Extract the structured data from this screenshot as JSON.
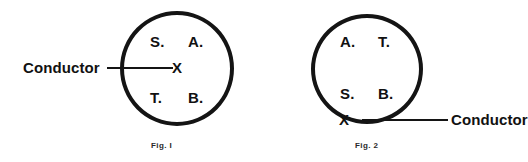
{
  "page": {
    "background_color": "#ffffff",
    "ink_color": "#141414"
  },
  "figures": [
    {
      "id": "fig1",
      "caption": "Fig. I",
      "circle": {
        "stroke_color": "#141414",
        "fill": "none"
      },
      "center_marker": "X",
      "conductor_label": "Conductor",
      "conductor_side": "left",
      "quadrants": {
        "top_left": "S.",
        "top_right": "A.",
        "bottom_left": "T.",
        "bottom_right": "B."
      }
    },
    {
      "id": "fig2",
      "caption": "Fig. 2",
      "circle": {
        "stroke_color": "#141414",
        "fill": "none"
      },
      "center_marker": "X",
      "conductor_label": "Conductor",
      "conductor_side": "right",
      "quadrants": {
        "top_left": "A.",
        "top_right": "T.",
        "bottom_left": "S.",
        "bottom_right": "B."
      }
    }
  ]
}
